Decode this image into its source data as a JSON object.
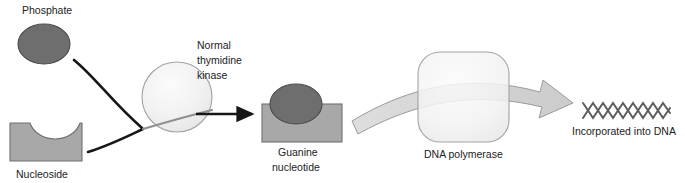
{
  "diagram": {
    "labels": {
      "phosphate": "Phosphate",
      "nucleoside": "Nucleoside",
      "kinase_line1": "Normal",
      "kinase_line2": "thymidine",
      "kinase_line3": "kinase",
      "nucleotide_line1": "Guanine",
      "nucleotide_line2": "nucleotide",
      "polymerase": "DNA polymerase",
      "incorporated": "Incorporated into DNA"
    },
    "icons": {
      "phosphate": "phosphate-circle-icon",
      "nucleoside": "nucleoside-notched-block-icon",
      "kinase": "kinase-circle-icon",
      "nucleotide_base": "nucleotide-block-icon",
      "nucleotide_phosphate": "nucleotide-phosphate-circle-icon",
      "polymerase": "dna-polymerase-rounded-square-icon",
      "dna": "dna-double-helix-icon",
      "arrow_phosphate": "phosphate-to-kinase-arrow",
      "arrow_nucleoside": "nucleoside-to-kinase-arrow",
      "arrow_product": "kinase-to-nucleotide-arrow",
      "arrow_band": "nucleotide-through-polymerase-arrow"
    },
    "colors": {
      "dark_gray_fill": "#6e6e6e",
      "dark_gray_stroke": "#4a4a4a",
      "mid_gray_fill": "#a8a8a8",
      "mid_gray_stroke": "#6f6f6f",
      "light_fill": "#f2f2f2",
      "light_stroke": "#9a9a9a",
      "band_fill": "#d4d4d4",
      "band_stroke": "#9a9a9a",
      "arrow_black": "#161616",
      "text": "#222222",
      "dna_stroke": "#5d5d5d",
      "background": "#ffffff"
    }
  }
}
